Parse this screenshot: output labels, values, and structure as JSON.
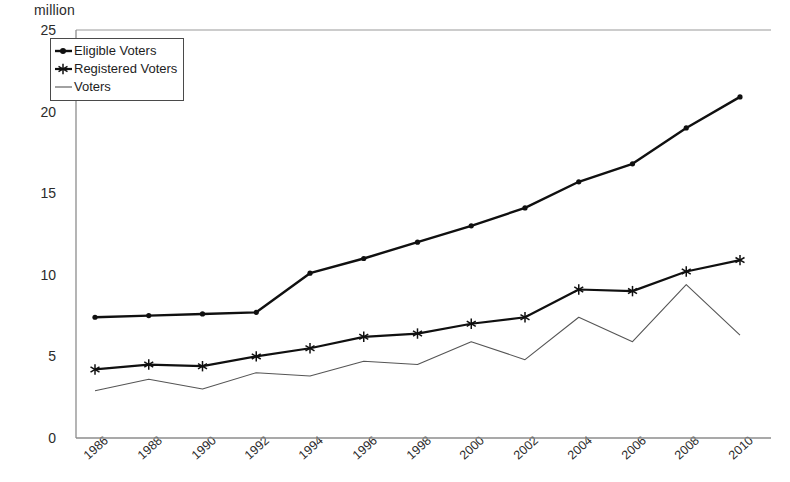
{
  "chart_data": {
    "type": "line",
    "title": "",
    "subtitle": "",
    "unit_label": "million",
    "xlabel": "",
    "ylabel": "million",
    "grid": false,
    "legend_position": "top-left",
    "ylim": [
      0,
      25
    ],
    "yticks": [
      0,
      5,
      10,
      15,
      20,
      25
    ],
    "categories": [
      "1986",
      "1988",
      "1990",
      "1992",
      "1994",
      "1996",
      "1998",
      "2000",
      "2002",
      "2004",
      "2006",
      "2008",
      "2010"
    ],
    "x": [
      1986,
      1988,
      1990,
      1992,
      1994,
      1996,
      1998,
      2000,
      2002,
      2004,
      2006,
      2008,
      2010
    ],
    "series": [
      {
        "name": "Eligible Voters",
        "marker": "dot",
        "color": "#101010",
        "line_width": 2.4,
        "values": [
          7.4,
          7.5,
          7.6,
          7.7,
          10.1,
          11.0,
          12.0,
          13.0,
          14.1,
          15.7,
          16.8,
          19.0,
          20.9
        ]
      },
      {
        "name": "Registered Voters",
        "marker": "star",
        "color": "#101010",
        "line_width": 2.2,
        "values": [
          4.2,
          4.5,
          4.4,
          5.0,
          5.5,
          6.2,
          6.4,
          7.0,
          7.4,
          9.1,
          9.0,
          10.2,
          10.9
        ]
      },
      {
        "name": "Voters",
        "marker": "none",
        "color": "#555555",
        "line_width": 1.1,
        "values": [
          2.9,
          3.6,
          3.0,
          4.0,
          3.8,
          4.7,
          4.5,
          5.9,
          4.8,
          7.4,
          5.9,
          9.4,
          6.3
        ]
      }
    ]
  },
  "legend": {
    "items": [
      {
        "label": "Eligible Voters",
        "marker": "dot-marker"
      },
      {
        "label": "Registered Voters",
        "marker": "star-marker"
      },
      {
        "label": "Voters",
        "marker": "plain-line-marker"
      }
    ]
  },
  "axes": {
    "y_tick_labels": [
      "25",
      "20",
      "15",
      "10",
      "5",
      "0"
    ],
    "x_tick_labels": [
      "1986",
      "1988",
      "1990",
      "1992",
      "1994",
      "1996",
      "1998",
      "2000",
      "2002",
      "2004",
      "2006",
      "2008",
      "2010"
    ]
  }
}
